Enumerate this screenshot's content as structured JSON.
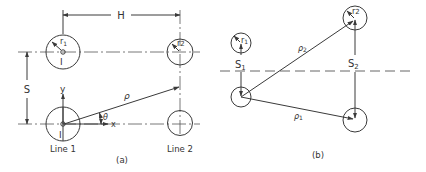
{
  "figure_a": {
    "caption": "(a)",
    "labels": {
      "H": "H",
      "S": "S",
      "r1": "r",
      "r1_sub": "1",
      "r2": "r",
      "r2_sub": "2",
      "I_upper": "I",
      "I_lower": "I",
      "y_axis": "y",
      "x_axis": "x",
      "rho": "ρ",
      "theta": "θ",
      "line1": "Line 1",
      "line2": "Line 2"
    }
  },
  "figure_b": {
    "caption": "(b)",
    "labels": {
      "r1": "r",
      "r1_sub": "1",
      "r2": "r",
      "r2_sub": "2",
      "S1": "S",
      "S1_sub": "1",
      "S2": "S",
      "S2_sub": "2",
      "rho1": "ρ",
      "rho1_sub": "1",
      "rho2": "ρ",
      "rho2_sub": "2"
    }
  },
  "colors": {
    "ink": "#3a3a3a",
    "background": "#ffffff"
  }
}
